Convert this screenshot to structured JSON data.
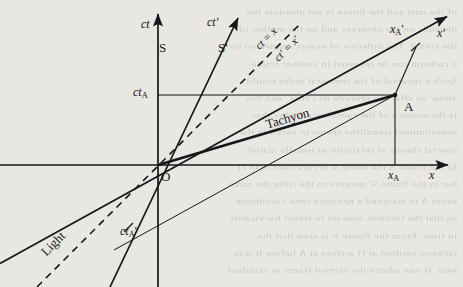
{
  "figure": {
    "kind": "minkowski-spacetime-diagram",
    "title_hidden": "Tachyon causality diagram",
    "background_note": "scanned book page with faint reverse-side bleed-through text"
  },
  "axes": {
    "ct": {
      "label": "ct",
      "frame_label": "S"
    },
    "x": {
      "label": "x"
    },
    "ct_prime": {
      "label": "ct'",
      "frame_label": "S'"
    },
    "x_prime": {
      "label": "x'"
    }
  },
  "labels": {
    "origin": "O",
    "event_A": "A",
    "x_A": "x",
    "x_A_sub": "A",
    "ct_A": "ct",
    "ct_A_sub": "A",
    "x_A_prime": "x",
    "x_A_prime_sub": "A",
    "x_A_prime_mark": "'",
    "ct_A_prime": "ct",
    "ct_A_prime_sub": "A",
    "ct_A_prime_mark": "'",
    "tachyon": "Tachyon",
    "light": "Light",
    "light_cone_S": "ct = x",
    "light_cone_Sprime": "ct' = x'"
  },
  "colors": {
    "ink": "#17161a",
    "paper": "#e9e7e2",
    "bleed_text": "#8d8a84"
  },
  "geometry": {
    "origin": [
      158,
      165
    ],
    "event_A": [
      395,
      95
    ],
    "ct_A_y": 95,
    "x_A_prime_point": [
      415,
      47
    ],
    "ct_A_prime_point": [
      128,
      227
    ],
    "note": "pixel coordinates within the 463x287 frame"
  },
  "bleed_lines": [
    "of the past and the future is not absolute but",
    "depends on the observer and on the motion of",
    "the signal. The ordering of events connected by",
    "a tachyon can be reversed in another frame.",
    "Such a reversal of the temporal order would",
    "allow an effect to precede its cause, and this",
    "is the essence of the causality paradox that",
    "superluminal signalling seems to entail in the",
    "special theory of relativity as usually stated.",
    "In the frame S the event A occurs later than O,",
    "but in the frame S' moving to the right the same",
    "event A is assigned a negative time coordinate,",
    "so that the tachyon appears to travel backwards",
    "in time. From the figure it is seen that the",
    "tachyon emitted at O arrives at A before it was",
    "sent, if one adopts the primed frame as standard."
  ]
}
